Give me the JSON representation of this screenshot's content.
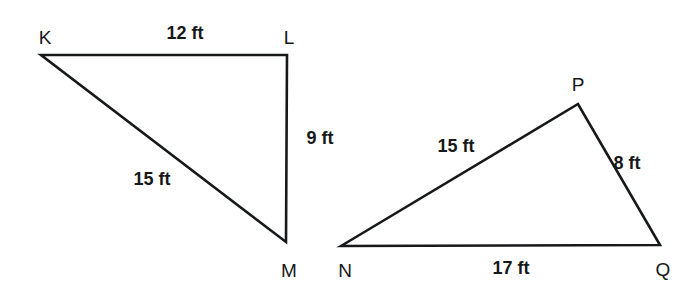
{
  "figure": {
    "background_color": "#ffffff",
    "stroke_color": "#17181a",
    "text_color": "#17181a",
    "unit": "ft"
  },
  "triangles": [
    {
      "name": "triangle-klm",
      "vertices": [
        {
          "name": "K",
          "label": "K",
          "x": 41,
          "y": 55,
          "label_x": 45,
          "label_y": 37
        },
        {
          "name": "L",
          "label": "L",
          "x": 287,
          "y": 55,
          "label_x": 289,
          "label_y": 37
        },
        {
          "name": "M",
          "label": "M",
          "x": 286,
          "y": 242,
          "label_x": 289,
          "label_y": 270
        }
      ],
      "sides": [
        {
          "name": "side-kl",
          "from": "K",
          "to": "L",
          "length": "12 ft",
          "label_x": 185,
          "label_y": 33
        },
        {
          "name": "side-lm",
          "from": "L",
          "to": "M",
          "length": "9 ft",
          "label_x": 320,
          "label_y": 138
        },
        {
          "name": "side-km",
          "from": "K",
          "to": "M",
          "length": "15 ft",
          "label_x": 152,
          "label_y": 179
        }
      ]
    },
    {
      "name": "triangle-npq",
      "vertices": [
        {
          "name": "N",
          "label": "N",
          "x": 341,
          "y": 246,
          "label_x": 345,
          "label_y": 270
        },
        {
          "name": "P",
          "label": "P",
          "x": 578,
          "y": 104,
          "label_x": 578,
          "label_y": 84
        },
        {
          "name": "Q",
          "label": "Q",
          "x": 660,
          "y": 245,
          "label_x": 663,
          "label_y": 269
        }
      ],
      "sides": [
        {
          "name": "side-np",
          "from": "N",
          "to": "P",
          "length": "15 ft",
          "label_x": 456,
          "label_y": 146
        },
        {
          "name": "side-pq",
          "from": "P",
          "to": "Q",
          "length": "8 ft",
          "label_x": 627,
          "label_y": 163
        },
        {
          "name": "side-nq",
          "from": "N",
          "to": "Q",
          "length": "17 ft",
          "label_x": 511,
          "label_y": 268
        }
      ]
    }
  ]
}
